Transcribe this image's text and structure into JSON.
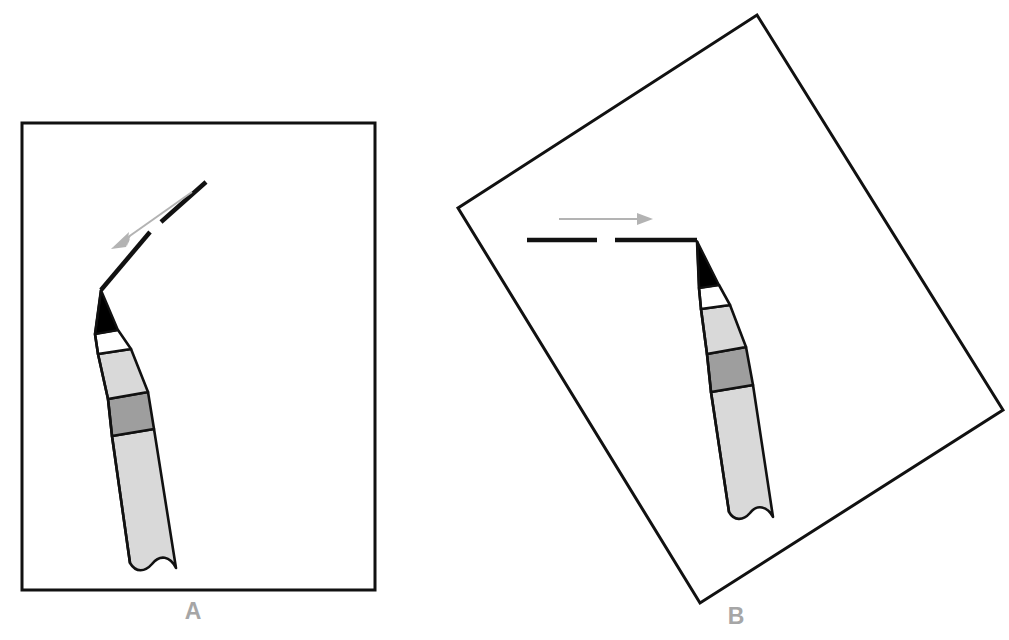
{
  "figure": {
    "background_color": "#ffffff",
    "width": 1009,
    "height": 640,
    "panels": [
      {
        "id": "A",
        "label": "A",
        "label_color": "#a6a6a6",
        "label_position": {
          "x": 193,
          "y": 613
        },
        "paper": {
          "shape": "rectangle",
          "rotation_deg": 0,
          "stroke_color": "#111111",
          "stroke_width": 3,
          "fill": "#ffffff",
          "corners": [
            {
              "x": 22,
              "y": 123
            },
            {
              "x": 375,
              "y": 123
            },
            {
              "x": 375,
              "y": 590
            },
            {
              "x": 22,
              "y": 590
            }
          ]
        },
        "drawn_stroke": {
          "description": "bent pencil stroke with a dashed gap, drawn diagonally down-left",
          "color": "#111111",
          "width": 4,
          "segments": [
            {
              "from": {
                "x": 206,
                "y": 182
              },
              "to": {
                "x": 161,
                "y": 222
              }
            },
            {
              "from": {
                "x": 150,
                "y": 232
              },
              "to": {
                "x": 101,
                "y": 290
              }
            }
          ]
        },
        "direction_arrow": {
          "color": "#b3b3b3",
          "width": 2,
          "from": {
            "x": 192,
            "y": 192
          },
          "to": {
            "x": 112,
            "y": 248
          },
          "head_length": 16,
          "head_width": 9,
          "meaning": "stroke direction: down and to the left"
        },
        "pencil": {
          "tilt_deg": 15,
          "tip_point": {
            "x": 101,
            "y": 290
          },
          "parts": [
            {
              "name": "graphite-tip",
              "color": "#000000"
            },
            {
              "name": "wood-collar",
              "color": "#ffffff"
            },
            {
              "name": "barrel-upper",
              "color": "#d9d9d9"
            },
            {
              "name": "ferrule-band",
              "color": "#9e9e9e"
            },
            {
              "name": "barrel-lower",
              "color": "#d9d9d9"
            }
          ],
          "bottom_edge": "wavy"
        }
      },
      {
        "id": "B",
        "label": "B",
        "label_color": "#a6a6a6",
        "label_position": {
          "x": 736,
          "y": 618
        },
        "paper": {
          "shape": "rectangle",
          "rotation_deg": -31,
          "stroke_color": "#111111",
          "stroke_width": 3,
          "fill": "#ffffff",
          "corners": [
            {
              "x": 757,
              "y": 15
            },
            {
              "x": 1003,
              "y": 410
            },
            {
              "x": 700,
              "y": 603
            },
            {
              "x": 458,
              "y": 208
            }
          ]
        },
        "drawn_stroke": {
          "description": "horizontal pencil stroke with a dashed gap, drawn left to right",
          "color": "#111111",
          "width": 4,
          "segments": [
            {
              "from": {
                "x": 527,
                "y": 240
              },
              "to": {
                "x": 597,
                "y": 240
              }
            },
            {
              "from": {
                "x": 615,
                "y": 240
              },
              "to": {
                "x": 697,
                "y": 240
              }
            }
          ]
        },
        "direction_arrow": {
          "color": "#b3b3b3",
          "width": 2,
          "from": {
            "x": 559,
            "y": 219
          },
          "to": {
            "x": 652,
            "y": 219
          },
          "head_length": 15,
          "head_width": 9,
          "meaning": "stroke direction: to the right"
        },
        "pencil": {
          "tilt_deg": 8,
          "tip_point": {
            "x": 697,
            "y": 241
          },
          "parts": [
            {
              "name": "graphite-tip",
              "color": "#000000"
            },
            {
              "name": "wood-collar",
              "color": "#ffffff"
            },
            {
              "name": "barrel-upper",
              "color": "#d9d9d9"
            },
            {
              "name": "ferrule-band",
              "color": "#9e9e9e"
            },
            {
              "name": "barrel-lower",
              "color": "#d9d9d9"
            }
          ],
          "bottom_edge": "wavy"
        }
      }
    ]
  }
}
